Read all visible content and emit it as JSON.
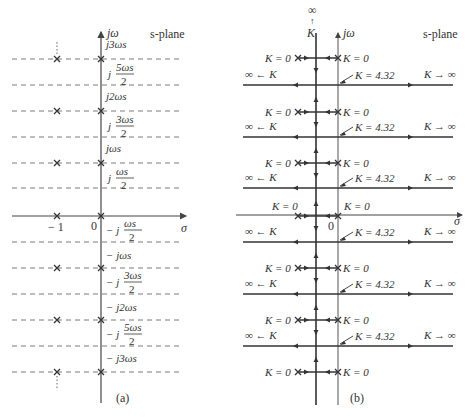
{
  "panel_a": {
    "caption": "(a)",
    "plane_label": "s-plane",
    "vertical_axis_label": "jω",
    "horizontal_axis_label": "σ",
    "origin_label": "0",
    "pole_x_label": "− 1",
    "freq_labels": [
      {
        "y": 48,
        "text": "j3ωs",
        "type": "simple"
      },
      {
        "y": 74,
        "prefix": "j",
        "num": "5ωs",
        "den": "2",
        "type": "frac"
      },
      {
        "y": 100,
        "text": "j2ωs",
        "type": "simple"
      },
      {
        "y": 126,
        "prefix": "j",
        "num": "3ωs",
        "den": "2",
        "type": "frac"
      },
      {
        "y": 152,
        "text": "jωs",
        "type": "simple"
      },
      {
        "y": 178,
        "prefix": "j",
        "num": "ωs",
        "den": "2",
        "type": "frac"
      },
      {
        "y": 230,
        "prefix": "− j",
        "num": "ωs",
        "den": "2",
        "type": "frac"
      },
      {
        "y": 259,
        "text": "− jωs",
        "type": "simple"
      },
      {
        "y": 282,
        "prefix": "− j",
        "num": "3ωs",
        "den": "2",
        "type": "frac"
      },
      {
        "y": 311,
        "text": "− j2ωs",
        "type": "simple"
      },
      {
        "y": 334,
        "prefix": "− j",
        "num": "5ωs",
        "den": "2",
        "type": "frac"
      },
      {
        "y": 362,
        "text": "− j3ωs",
        "type": "simple"
      }
    ],
    "dashed_lines_y": [
      59,
      85,
      111,
      137,
      163,
      188,
      242,
      268,
      294,
      320,
      346,
      372
    ],
    "pole_rows_y": [
      59,
      111,
      163,
      216,
      268,
      320,
      372
    ]
  },
  "panel_b": {
    "caption": "(b)",
    "plane_label": "s-plane",
    "vertical_axis_label": "jω",
    "horizontal_axis_label": "σ",
    "origin_label": "0",
    "top_infinity": "∞",
    "top_arrow": "↑",
    "top_K": "K",
    "pole_rows_y": [
      58,
      112,
      163,
      216,
      268,
      320,
      372
    ],
    "asymptote_rows_y": [
      85,
      137,
      188,
      242,
      294,
      346
    ],
    "pole_label_left": "K = 0",
    "pole_label_right": "K = 0",
    "breakaway_label": "K = 4.32",
    "left_infinity_label": "∞ ← K",
    "right_infinity_label": "K → ∞",
    "locus_color": "#333333"
  },
  "colors": {
    "axis": "#444444",
    "dash": "#7a7a7a",
    "text": "#333333",
    "background": "#ffffff"
  }
}
